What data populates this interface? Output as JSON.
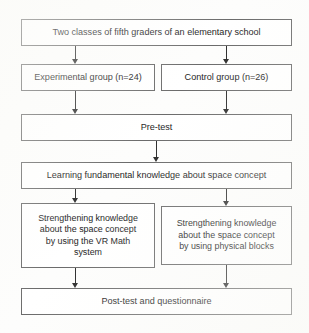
{
  "diagram": {
    "type": "flowchart",
    "accent_color": "#2b2b2b",
    "border_color": "#6b6b6b",
    "box_fill": "#ffffff",
    "background": "#fdfdfc",
    "nodes": {
      "population": {
        "id": "population",
        "label": "Two classes of fifth graders of an elementary school"
      },
      "experimental": {
        "id": "experimental",
        "label": "Experimental group (n=24)",
        "group": "Experimental group",
        "n": 24
      },
      "control": {
        "id": "control",
        "label": "Control group (n=26)",
        "group": "Control group",
        "n": 26
      },
      "pretest": {
        "id": "pretest",
        "label": "Pre-test"
      },
      "learning": {
        "id": "learning",
        "label": "Learning fundamental knowledge about space concept"
      },
      "vr_treatment": {
        "id": "vr_treatment",
        "label": "Strengthening knowledge\nabout the space concept\nby using the VR Math\nsystem"
      },
      "blocks_treatment": {
        "id": "blocks_treatment",
        "label": "Strengthening knowledge\nabout the space concept\nby using physical blocks"
      },
      "posttest": {
        "id": "posttest",
        "label": "Post-test and questionnaire"
      }
    },
    "edges": [
      {
        "id": "pop-exp",
        "from": "population",
        "to": "experimental",
        "direction": "down"
      },
      {
        "id": "pop-ctrl",
        "from": "population",
        "to": "control",
        "direction": "down"
      },
      {
        "id": "exp-pre",
        "from": "experimental",
        "to": "pretest",
        "direction": "down"
      },
      {
        "id": "ctrl-pre",
        "from": "control",
        "to": "pretest",
        "direction": "down"
      },
      {
        "id": "pre-learn",
        "from": "pretest",
        "to": "learning",
        "direction": "down"
      },
      {
        "id": "learn-vr",
        "from": "learning",
        "to": "vr_treatment",
        "direction": "down"
      },
      {
        "id": "learn-blk",
        "from": "learning",
        "to": "blocks_treatment",
        "direction": "down"
      },
      {
        "id": "vr-post",
        "from": "vr_treatment",
        "to": "posttest",
        "direction": "down"
      },
      {
        "id": "blk-post",
        "from": "blocks_treatment",
        "to": "posttest",
        "direction": "down"
      }
    ]
  }
}
